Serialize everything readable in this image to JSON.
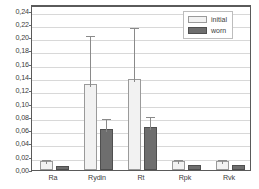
{
  "chart_data": {
    "type": "bar",
    "title": "",
    "subtitle": "",
    "xlabel": "",
    "ylabel": "",
    "categories": [
      "Ra",
      "Rydin",
      "Rt",
      "Rpk",
      "Rvk"
    ],
    "series": [
      {
        "name": "initial",
        "color": "#f2f2f2",
        "values": [
          0.0135,
          0.129,
          0.137,
          0.0135,
          0.0135
        ],
        "error_upper": [
          0.019,
          0.207,
          0.219,
          0.019,
          0.019
        ]
      },
      {
        "name": "worn",
        "color": "#6e6e6e",
        "values": [
          0.0055,
          0.062,
          0.065,
          0.008,
          0.008
        ],
        "error_upper": [
          0.0055,
          0.082,
          0.085,
          0.008,
          0.008
        ]
      }
    ],
    "ylim": [
      0.0,
      0.25
    ],
    "y_ticks": [
      0.0,
      0.02,
      0.04,
      0.06,
      0.08,
      0.1,
      0.12,
      0.14,
      0.16,
      0.18,
      0.2,
      0.22,
      0.24
    ],
    "y_tick_labels": [
      "0,00",
      "0,02",
      "0,04",
      "0,06",
      "0,08",
      "0,10",
      "0,12",
      "0,14",
      "0,16",
      "0,18",
      "0,20",
      "0,22",
      "0,24"
    ],
    "grid": true,
    "legend_position": "top-right",
    "decimal_separator": ","
  },
  "legend": {
    "entries": [
      {
        "label": "initial"
      },
      {
        "label": "worn"
      }
    ]
  }
}
